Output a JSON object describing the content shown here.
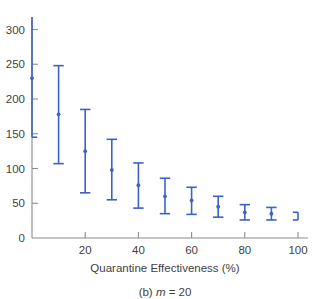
{
  "figure": {
    "caption_prefix": "(b)",
    "caption_var": "m",
    "caption_eq": "=",
    "caption_value": "20",
    "caption_full": "(b) m = 20"
  },
  "chart_data": {
    "type": "scatter",
    "title": "",
    "xlabel": "Quarantine Effectiveness (%)",
    "ylabel": "",
    "xlim": [
      0,
      100
    ],
    "ylim": [
      0,
      318
    ],
    "grid": false,
    "legend": null,
    "marker_color": "#3b62c4",
    "errorbar_color": "#3b62c4",
    "axis_color": "#8c8c8c",
    "x": [
      0,
      10,
      20,
      30,
      40,
      50,
      60,
      70,
      80,
      90,
      100
    ],
    "values": [
      230,
      178,
      125,
      98,
      76,
      60,
      54,
      45,
      37,
      35,
      31
    ],
    "error_low": [
      145,
      107,
      65,
      55,
      43,
      35,
      34,
      30,
      26,
      26,
      26
    ],
    "error_high": [
      318,
      248,
      185,
      142,
      108,
      86,
      73,
      60,
      48,
      44,
      37
    ],
    "error_high_clipped": [
      true,
      false,
      false,
      false,
      false,
      false,
      false,
      false,
      false,
      false,
      false
    ],
    "xticks": [
      0,
      20,
      40,
      60,
      80,
      100
    ],
    "xticklabels": [
      "",
      "20",
      "40",
      "60",
      "80",
      "100"
    ],
    "yticks": [
      0,
      50,
      100,
      150,
      200,
      250,
      300
    ],
    "yticklabels": [
      "0",
      "50",
      "100",
      "150",
      "200",
      "250",
      "300"
    ]
  }
}
